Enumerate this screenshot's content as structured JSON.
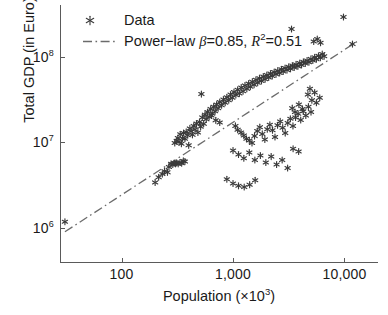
{
  "chart_data": {
    "type": "scatter",
    "title": "",
    "xlabel": "Population (×10³)",
    "ylabel": "Total GDP (in Euro)",
    "xscale": "log",
    "yscale": "log",
    "xlim": [
      28,
      20000
    ],
    "ylim": [
      400000,
      400000000
    ],
    "grid": false,
    "xticks": [
      100,
      1000,
      10000
    ],
    "xticklabels": [
      "100",
      "1,000",
      "10,000"
    ],
    "yticks": [
      1000000,
      10000000,
      100000000
    ],
    "yticklabels": [
      "10⁶",
      "10⁷",
      "10⁸"
    ],
    "legend_position": "upper-left",
    "series": [
      {
        "name": "Data",
        "type": "scatter",
        "marker": "asterisk",
        "color": "#3a3a3a",
        "points": [
          [
            31,
            1180000
          ],
          [
            200,
            3400000
          ],
          [
            215,
            3900000
          ],
          [
            232,
            4250000
          ],
          [
            243,
            4600000
          ],
          [
            258,
            4450000
          ],
          [
            266,
            5150000
          ],
          [
            278,
            5600000
          ],
          [
            288,
            5500000
          ],
          [
            296,
            5700000
          ],
          [
            305,
            5600000
          ],
          [
            312,
            5750000
          ],
          [
            322,
            5600000
          ],
          [
            334,
            5800000
          ],
          [
            346,
            5700000
          ],
          [
            358,
            6050000
          ],
          [
            370,
            5950000
          ],
          [
            300,
            9800000
          ],
          [
            312,
            10400000
          ],
          [
            320,
            11200000
          ],
          [
            328,
            10100000
          ],
          [
            336,
            12400000
          ],
          [
            344,
            9600000
          ],
          [
            352,
            11100000
          ],
          [
            360,
            12800000
          ],
          [
            370,
            11000000
          ],
          [
            380,
            13200000
          ],
          [
            392,
            12100000
          ],
          [
            400,
            9200000
          ],
          [
            410,
            14500000
          ],
          [
            420,
            13400000
          ],
          [
            432,
            12200000
          ],
          [
            444,
            15500000
          ],
          [
            456,
            14100000
          ],
          [
            470,
            16500000
          ],
          [
            484,
            13000000
          ],
          [
            500,
            17200000
          ],
          [
            512,
            15200000
          ],
          [
            530,
            19500000
          ],
          [
            545,
            16400000
          ],
          [
            560,
            21000000
          ],
          [
            575,
            18500000
          ],
          [
            590,
            22500000
          ],
          [
            610,
            19800000
          ],
          [
            630,
            24500000
          ],
          [
            650,
            21500000
          ],
          [
            670,
            26000000
          ],
          [
            690,
            23000000
          ],
          [
            712,
            27500000
          ],
          [
            735,
            25000000
          ],
          [
            760,
            29500000
          ],
          [
            790,
            27000000
          ],
          [
            820,
            31500000
          ],
          [
            850,
            29000000
          ],
          [
            880,
            33500000
          ],
          [
            915,
            31000000
          ],
          [
            950,
            36000000
          ],
          [
            985,
            33000000
          ],
          [
            1020,
            38500000
          ],
          [
            1060,
            35500000
          ],
          [
            1100,
            41000000
          ],
          [
            1140,
            37000000
          ],
          [
            1185,
            43500000
          ],
          [
            1230,
            39500000
          ],
          [
            1280,
            46000000
          ],
          [
            1330,
            42000000
          ],
          [
            1380,
            48500000
          ],
          [
            1430,
            44500000
          ],
          [
            1490,
            51000000
          ],
          [
            1545,
            47000000
          ],
          [
            1605,
            53500000
          ],
          [
            1665,
            49500000
          ],
          [
            1730,
            56000000
          ],
          [
            1800,
            52000000
          ],
          [
            1870,
            58500000
          ],
          [
            1940,
            54500000
          ],
          [
            2010,
            61000000
          ],
          [
            2090,
            57000000
          ],
          [
            2170,
            63500000
          ],
          [
            2250,
            59500000
          ],
          [
            2340,
            66000000
          ],
          [
            2430,
            62000000
          ],
          [
            2520,
            68500000
          ],
          [
            2620,
            64500000
          ],
          [
            2720,
            71000000
          ],
          [
            2820,
            67000000
          ],
          [
            2930,
            73500000
          ],
          [
            3050,
            69500000
          ],
          [
            3160,
            76000000
          ],
          [
            3280,
            72000000
          ],
          [
            3410,
            78500000
          ],
          [
            3540,
            74500000
          ],
          [
            3680,
            81000000
          ],
          [
            3820,
            77000000
          ],
          [
            3970,
            84000000
          ],
          [
            4120,
            80000000
          ],
          [
            4280,
            87000000
          ],
          [
            4450,
            83000000
          ],
          [
            4620,
            90000000
          ],
          [
            4800,
            86000000
          ],
          [
            5000,
            94000000
          ],
          [
            5200,
            90000000
          ],
          [
            5400,
            98000000
          ],
          [
            5600,
            93000000
          ],
          [
            5850,
            102000000
          ],
          [
            6080,
            97000000
          ],
          [
            6320,
            107000000
          ],
          [
            6570,
            101000000
          ],
          [
            520,
            36500000
          ],
          [
            640,
            20500000
          ],
          [
            700,
            18000000
          ],
          [
            760,
            17000000
          ],
          [
            1050,
            15500000
          ],
          [
            1100,
            14000000
          ],
          [
            1180,
            13000000
          ],
          [
            1250,
            12000000
          ],
          [
            1320,
            11000000
          ],
          [
            1400,
            10500000
          ],
          [
            1480,
            9800000
          ],
          [
            1560,
            11800000
          ],
          [
            1650,
            13500000
          ],
          [
            1740,
            15000000
          ],
          [
            1830,
            12500000
          ],
          [
            1930,
            10800000
          ],
          [
            2030,
            14200000
          ],
          [
            2140,
            16000000
          ],
          [
            2260,
            13800000
          ],
          [
            2380,
            11500000
          ],
          [
            2510,
            15800000
          ],
          [
            2650,
            17500000
          ],
          [
            2790,
            14800000
          ],
          [
            2940,
            12800000
          ],
          [
            3100,
            16800000
          ],
          [
            3270,
            18800000
          ],
          [
            3450,
            15500000
          ],
          [
            3640,
            19500000
          ],
          [
            3840,
            21500000
          ],
          [
            4050,
            18200000
          ],
          [
            4270,
            23000000
          ],
          [
            4500,
            20500000
          ],
          [
            4750,
            26000000
          ],
          [
            5010,
            22500000
          ],
          [
            1000,
            8000000
          ],
          [
            1120,
            7200000
          ],
          [
            1250,
            6500000
          ],
          [
            1400,
            7600000
          ],
          [
            1570,
            6200000
          ],
          [
            1760,
            7000000
          ],
          [
            1970,
            5800000
          ],
          [
            2200,
            6800000
          ],
          [
            2460,
            5500000
          ],
          [
            2760,
            6200000
          ],
          [
            3090,
            5000000
          ],
          [
            3460,
            8400000
          ],
          [
            3880,
            7800000
          ],
          [
            880,
            3700000
          ],
          [
            1000,
            3300000
          ],
          [
            1120,
            3100000
          ],
          [
            1260,
            3000000
          ],
          [
            1410,
            3200000
          ],
          [
            1580,
            3600000
          ],
          [
            3350,
            210000000
          ],
          [
            9800,
            290000000
          ],
          [
            11800,
            140000000
          ],
          [
            5300,
            150000000
          ],
          [
            5700,
            160000000
          ],
          [
            6100,
            145000000
          ],
          [
            4900,
            42000000
          ],
          [
            5400,
            38000000
          ],
          [
            5100,
            31000000
          ],
          [
            5600,
            29000000
          ],
          [
            6000,
            33000000
          ],
          [
            4700,
            36000000
          ],
          [
            3400,
            25000000
          ],
          [
            3600,
            22500000
          ],
          [
            3900,
            27500000
          ],
          [
            4200,
            24500000
          ]
        ]
      },
      {
        "name": "Power-law β=0.85, R²=0.51",
        "type": "line",
        "linestyle": "dashdot",
        "color": "#6b6b6b",
        "beta": 0.85,
        "r_squared": 0.51,
        "endpoints": [
          [
            31,
            900000
          ],
          [
            13500,
            155000000
          ]
        ]
      }
    ]
  },
  "axes": {
    "x": {
      "label_prefix": "Population (×10",
      "label_sup": "3",
      "label_suffix": ")",
      "ticks": [
        {
          "value": 100,
          "label": "100"
        },
        {
          "value": 1000,
          "label": "1,000"
        },
        {
          "value": 10000,
          "label": "10,000"
        }
      ]
    },
    "y": {
      "label": "Total GDP (in Euro)",
      "ticks": [
        {
          "value": 100000000,
          "mantissa": "10",
          "exponent": "8"
        },
        {
          "value": 10000000,
          "mantissa": "10",
          "exponent": "7"
        },
        {
          "value": 1000000,
          "mantissa": "10",
          "exponent": "6"
        }
      ]
    }
  },
  "legend": {
    "entries": [
      {
        "label": "Data",
        "marker": "asterisk-marker"
      },
      {
        "label_prefix": "Power−law ",
        "beta_symbol": "β",
        "beta_value": "=0.85, ",
        "r_symbol": "R",
        "r_exponent": "2",
        "r_value": "=0.51",
        "marker": "dashdot-line"
      }
    ]
  },
  "colors": {
    "marker": "#3a3a3a",
    "fit_line": "#6b6b6b",
    "axis": "#5a5a5a",
    "text": "#1a1a1a",
    "background": "#ffffff"
  }
}
